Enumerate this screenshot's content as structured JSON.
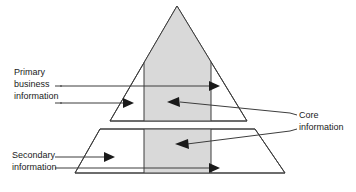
{
  "diagram": {
    "colors": {
      "core_fill": "#d9d9d9",
      "outline": "#3d3d3d",
      "background": "#ffffff",
      "text": "#1a1a1a",
      "arrow": "#1a1a1a"
    },
    "labels": {
      "primary": {
        "name": "primary-business-information",
        "line1": "Primary",
        "line2": "business",
        "line3": "information"
      },
      "secondary": {
        "name": "secondary-information",
        "line1": "Secondary",
        "line2": "information"
      },
      "core": {
        "name": "core-information",
        "line1": "Core",
        "line2": "information"
      }
    },
    "shapes": [
      {
        "name": "pyramid-triangle",
        "type": "triangle",
        "points": "177,6 247,121 110,121"
      },
      {
        "name": "base-trapezoid",
        "type": "trapezoid",
        "points": "100,129 255,129 285,173 75,173"
      }
    ],
    "core_bands": [
      {
        "name": "core-band-triangle",
        "points": "144,56 211,56 211,121 144,121"
      },
      {
        "name": "core-band-trapezoid",
        "points": "144,129 211,129 211,173 144,173"
      }
    ],
    "flow_arrows": [
      {
        "name": "primary-flow-arrow-upper",
        "direction": "right"
      },
      {
        "name": "primary-flow-arrow-lower",
        "direction": "right"
      },
      {
        "name": "core-inflow-arrow-triangle",
        "direction": "left"
      },
      {
        "name": "core-inflow-arrow-trapezoid",
        "direction": "left"
      },
      {
        "name": "secondary-flow-arrow-upper",
        "direction": "right"
      },
      {
        "name": "secondary-flow-arrow-lower",
        "direction": "right"
      }
    ]
  }
}
